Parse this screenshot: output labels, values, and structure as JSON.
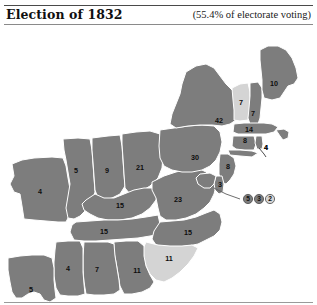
{
  "header": {
    "title": "Election of 1832",
    "turnout": "(55.4% of electorate voting)"
  },
  "legend": {
    "jackson_color": "#7d7d7d",
    "other_color": "#d4d4d4",
    "border_color": "#ffffff",
    "label_color": "#0d0d0d"
  },
  "chart_data": {
    "type": "map",
    "title": "Election of 1832",
    "subtitle": "(55.4% of electorate voting)",
    "value_label": "electoral votes",
    "grid": false,
    "legend_position": "none",
    "shading": {
      "dark": "carried by Jackson (Democrat)",
      "light": "carried by opposition"
    },
    "states": [
      {
        "code": "ME",
        "name": "Maine",
        "value": 10,
        "shade": "dark",
        "lx": 274,
        "ly": 58
      },
      {
        "code": "VT",
        "name": "Vermont",
        "value": 7,
        "shade": "light",
        "lx": 241,
        "ly": 77
      },
      {
        "code": "NH",
        "name": "New Hampshire",
        "value": 7,
        "shade": "dark",
        "lx": 253,
        "ly": 88
      },
      {
        "code": "MA",
        "name": "Massachusetts",
        "value": 14,
        "shade": "dark",
        "lx": 249,
        "ly": 104
      },
      {
        "code": "RI",
        "name": "Rhode Island",
        "value": 4,
        "shade": "dark",
        "lx": 266,
        "ly": 122
      },
      {
        "code": "CT",
        "name": "Connecticut",
        "value": 8,
        "shade": "dark",
        "lx": 245,
        "ly": 115
      },
      {
        "code": "NY",
        "name": "New York",
        "value": 42,
        "shade": "dark",
        "lx": 219,
        "ly": 95
      },
      {
        "code": "PA",
        "name": "Pennsylvania",
        "value": 30,
        "shade": "dark",
        "lx": 195,
        "ly": 132
      },
      {
        "code": "NJ",
        "name": "New Jersey",
        "value": 8,
        "shade": "dark",
        "lx": 228,
        "ly": 141
      },
      {
        "code": "DE",
        "name": "Delaware",
        "value": 3,
        "shade": "dark",
        "lx": 220,
        "ly": 159
      },
      {
        "code": "OH",
        "name": "Ohio",
        "value": 21,
        "shade": "dark",
        "lx": 140,
        "ly": 142
      },
      {
        "code": "IN",
        "name": "Indiana",
        "value": 9,
        "shade": "dark",
        "lx": 107,
        "ly": 145
      },
      {
        "code": "IL",
        "name": "Illinois",
        "value": 5,
        "shade": "dark",
        "lx": 76,
        "ly": 145
      },
      {
        "code": "MO",
        "name": "Missouri",
        "value": 4,
        "shade": "dark",
        "lx": 40,
        "ly": 166
      },
      {
        "code": "KY",
        "name": "Kentucky",
        "value": 15,
        "shade": "dark",
        "lx": 120,
        "ly": 180
      },
      {
        "code": "VA",
        "name": "Virginia",
        "value": 23,
        "shade": "dark",
        "lx": 178,
        "ly": 174
      },
      {
        "code": "TN",
        "name": "Tennessee",
        "value": 15,
        "shade": "dark",
        "lx": 104,
        "ly": 206
      },
      {
        "code": "NC",
        "name": "North Carolina",
        "value": 15,
        "shade": "dark",
        "lx": 188,
        "ly": 207
      },
      {
        "code": "SC",
        "name": "South Carolina",
        "value": 11,
        "shade": "light",
        "lx": 169,
        "ly": 233
      },
      {
        "code": "GA",
        "name": "Georgia",
        "value": 11,
        "shade": "dark",
        "lx": 137,
        "ly": 245
      },
      {
        "code": "AL",
        "name": "Alabama",
        "value": 7,
        "shade": "dark",
        "lx": 97,
        "ly": 244
      },
      {
        "code": "MS",
        "name": "Mississippi",
        "value": 4,
        "shade": "dark",
        "lx": 68,
        "ly": 243
      },
      {
        "code": "LA",
        "name": "Louisiana",
        "value": 5,
        "shade": "dark",
        "lx": 31,
        "ly": 264
      }
    ],
    "callout_circles": [
      {
        "code": "MD",
        "name": "Maryland",
        "value": 5,
        "shade": "dark",
        "cx": 248,
        "cy": 173
      },
      {
        "code": "MD",
        "name": "Maryland",
        "value": 3,
        "shade": "dark",
        "cx": 259,
        "cy": 173
      },
      {
        "code": "MD",
        "name": "Maryland",
        "value": 2,
        "shade": "light",
        "cx": 270,
        "cy": 173
      }
    ],
    "leader_labels": [
      {
        "for": "RI",
        "value": 4
      }
    ]
  }
}
